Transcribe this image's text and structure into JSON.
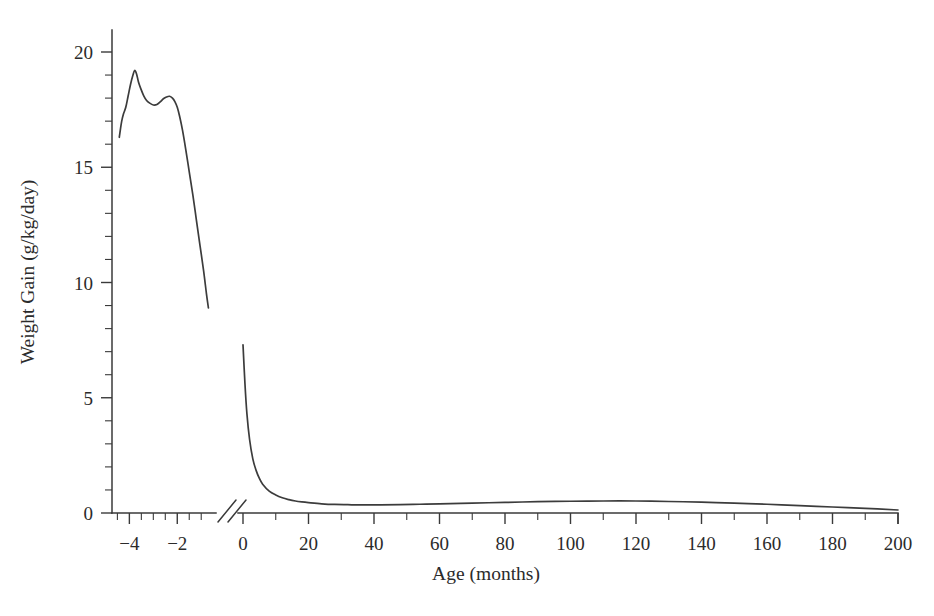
{
  "chart_data": {
    "type": "line",
    "title": "",
    "xlabel": "Age (months)",
    "ylabel": "Weight Gain (g/kg/day)",
    "xlim": [
      -4.6,
      200
    ],
    "ylim": [
      0,
      21
    ],
    "grid": false,
    "legend": null,
    "axis_break": {
      "present": true,
      "marker": "//",
      "between": [
        -0.7,
        -0.15
      ],
      "note": "x-axis broken between prenatal and postnatal segments"
    },
    "x_ticks_major": [
      -4,
      -2,
      0,
      20,
      40,
      60,
      80,
      100,
      120,
      140,
      160,
      180,
      200
    ],
    "x_tick_labels": [
      "−4",
      "−2",
      "0",
      "20",
      "40",
      "60",
      "80",
      "100",
      "120",
      "140",
      "160",
      "180",
      "200"
    ],
    "x_ticks_minor": [
      -4.5,
      -3.5,
      -3,
      -2.5,
      -1.5,
      -1,
      10,
      30,
      50,
      70,
      90,
      110,
      130,
      150,
      170,
      190
    ],
    "y_ticks_major": [
      0,
      5,
      10,
      15,
      20
    ],
    "y_tick_labels": [
      "0",
      "5",
      "10",
      "15",
      "20"
    ],
    "y_ticks_minor": [
      1,
      2,
      3,
      4,
      6,
      7,
      8,
      9,
      11,
      12,
      13,
      14,
      16,
      17,
      18,
      19,
      21
    ],
    "series": [
      {
        "name": "prenatal-weight-gain",
        "segment": "prenatal",
        "x": [
          -4.42,
          -4.38,
          -4.32,
          -4.25,
          -4.15,
          -4.05,
          -3.95,
          -3.85,
          -3.78,
          -3.7,
          -3.62,
          -3.52,
          -3.4,
          -3.28,
          -3.15,
          -3.0,
          -2.85,
          -2.7,
          -2.58,
          -2.45,
          -2.32,
          -2.2,
          -2.1,
          -2.0,
          -1.9,
          -1.78,
          -1.65,
          -1.5,
          -1.35,
          -1.2,
          -1.05,
          -0.9,
          -0.78,
          -0.7
        ],
        "y": [
          16.3,
          16.6,
          17.0,
          17.3,
          17.6,
          18.1,
          18.6,
          19.0,
          19.2,
          19.05,
          18.7,
          18.4,
          18.1,
          17.9,
          17.78,
          17.7,
          17.72,
          17.85,
          17.97,
          18.05,
          18.08,
          18.0,
          17.85,
          17.6,
          17.2,
          16.6,
          15.8,
          14.8,
          13.8,
          12.7,
          11.6,
          10.5,
          9.5,
          8.9
        ]
      },
      {
        "name": "postnatal-weight-gain",
        "segment": "postnatal",
        "x": [
          0,
          0.6,
          1.2,
          2,
          3,
          4,
          5,
          6,
          8,
          10,
          12,
          14,
          16,
          18,
          20,
          24,
          28,
          32,
          36,
          42,
          48,
          54,
          60,
          70,
          80,
          90,
          100,
          110,
          120,
          130,
          140,
          150,
          160,
          170,
          180,
          190,
          200
        ],
        "y": [
          7.3,
          5.6,
          4.3,
          3.2,
          2.35,
          1.85,
          1.5,
          1.25,
          0.95,
          0.78,
          0.66,
          0.58,
          0.52,
          0.48,
          0.45,
          0.4,
          0.37,
          0.36,
          0.35,
          0.35,
          0.36,
          0.38,
          0.4,
          0.43,
          0.46,
          0.49,
          0.51,
          0.52,
          0.52,
          0.5,
          0.47,
          0.43,
          0.38,
          0.32,
          0.26,
          0.2,
          0.13
        ]
      }
    ]
  },
  "axes": {
    "y_title": "Weight Gain (g/kg/day)",
    "x_title": "Age (months)"
  },
  "colors": {
    "curve": "#3c3c3c",
    "axis": "#3a3a3a",
    "text": "#2b2b2b",
    "background": "#ffffff"
  }
}
